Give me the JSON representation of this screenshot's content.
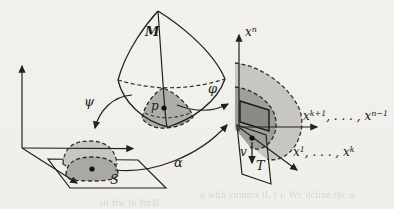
{
  "figure": {
    "background": "#f1f0ec",
    "ink": "#22211e",
    "grays": {
      "light_patch": "#c7c6c2",
      "medium_patch": "#a9a8a3",
      "inner_patch": "#9f9e99",
      "dark_quad": "#8b8a85"
    },
    "labels": {
      "manifold": "M",
      "point": "p",
      "psi": "ψ",
      "phi": "φ",
      "alpha": "α",
      "set_s": "S",
      "set_t": "T",
      "vector": "v",
      "axis_xn": {
        "base": "x",
        "sup": "n"
      },
      "axis_xk1": {
        "base1": "x",
        "sup1": "k+1",
        "sep": ", . . . , ",
        "base2": "x",
        "sup2": "n−1"
      },
      "axis_x1k": {
        "base1": "x",
        "sup1": "1",
        "sep": ", . . . , ",
        "base2": "x",
        "sup2": "k"
      }
    },
    "bleed_text": {
      "left_fragment": "ilt ftw lo ftndl",
      "right_fragment": "u wtih cumera tl. r i. Wc dcline thc u"
    }
  }
}
